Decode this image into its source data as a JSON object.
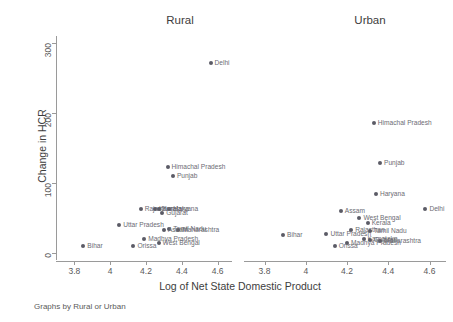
{
  "note": "Graphs by Rural or Urban",
  "axes": {
    "xlabel": "Log of Net State Domestic Product",
    "ylabel": "Change in HCR",
    "xticks": [
      "3.8",
      "4",
      "4.2",
      "4.4",
      "4.6"
    ],
    "yticks": [
      "0",
      "100",
      "200",
      "300"
    ]
  },
  "panels": [
    {
      "title": "Rural"
    },
    {
      "title": "Urban"
    }
  ],
  "chart_data": {
    "type": "scatter",
    "title": "",
    "xlabel": "Log of Net State Domestic Product",
    "ylabel": "Change in HCR",
    "xlim": [
      3.72,
      4.68
    ],
    "ylim": [
      -12,
      310
    ],
    "xticks": [
      3.8,
      4.0,
      4.2,
      4.4,
      4.6
    ],
    "yticks": [
      0,
      100,
      200,
      300
    ],
    "grid": false,
    "legend": null,
    "facet_by": "Rural or Urban",
    "facet_note": "Graphs by Rural or Urban",
    "point_color": "#5b5b66",
    "panels": [
      {
        "name": "Rural",
        "points": [
          {
            "label": "Delhi",
            "x": 4.56,
            "y": 272
          },
          {
            "label": "Himachal Pradesh",
            "x": 4.32,
            "y": 122
          },
          {
            "label": "Punjab",
            "x": 4.35,
            "y": 110
          },
          {
            "label": "Rajasthan",
            "x": 4.17,
            "y": 63
          },
          {
            "label": "Haryana",
            "x": 4.33,
            "y": 63
          },
          {
            "label": "Karnataka",
            "x": 4.25,
            "y": 63
          },
          {
            "label": "Kerala",
            "x": 4.27,
            "y": 62
          },
          {
            "label": "Gujarat",
            "x": 4.29,
            "y": 56
          },
          {
            "label": "Uttar Pradesh",
            "x": 4.05,
            "y": 40
          },
          {
            "label": "Tamil Nadu",
            "x": 4.33,
            "y": 34
          },
          {
            "label": "Maharashtra",
            "x": 4.38,
            "y": 33
          },
          {
            "label": "Assam",
            "x": 4.3,
            "y": 32
          },
          {
            "label": "Madhya Pradesh",
            "x": 4.19,
            "y": 20
          },
          {
            "label": "West Bengal",
            "x": 4.27,
            "y": 14
          },
          {
            "label": "Orissa",
            "x": 4.13,
            "y": 10
          },
          {
            "label": "Bihar",
            "x": 3.85,
            "y": 10
          }
        ]
      },
      {
        "name": "Urban",
        "points": [
          {
            "label": "Himachal Pradesh",
            "x": 4.33,
            "y": 185
          },
          {
            "label": "Punjab",
            "x": 4.36,
            "y": 128
          },
          {
            "label": "Haryana",
            "x": 4.34,
            "y": 84
          },
          {
            "label": "Delhi",
            "x": 4.58,
            "y": 62
          },
          {
            "label": "Assam",
            "x": 4.17,
            "y": 60
          },
          {
            "label": "West Bengal",
            "x": 4.26,
            "y": 50
          },
          {
            "label": "Kerala",
            "x": 4.3,
            "y": 42
          },
          {
            "label": "Rajasthan",
            "x": 4.22,
            "y": 32
          },
          {
            "label": "Tamil Nadu",
            "x": 4.31,
            "y": 31
          },
          {
            "label": "Uttar Pradesh",
            "x": 4.1,
            "y": 26
          },
          {
            "label": "Karnataka",
            "x": 4.28,
            "y": 19
          },
          {
            "label": "Gujarat",
            "x": 4.31,
            "y": 18
          },
          {
            "label": "Maharashtra",
            "x": 4.36,
            "y": 17
          },
          {
            "label": "Madhya Pradesh",
            "x": 4.2,
            "y": 14
          },
          {
            "label": "Bihar",
            "x": 3.89,
            "y": 25
          },
          {
            "label": "Orissa",
            "x": 4.14,
            "y": 10
          }
        ]
      }
    ]
  }
}
